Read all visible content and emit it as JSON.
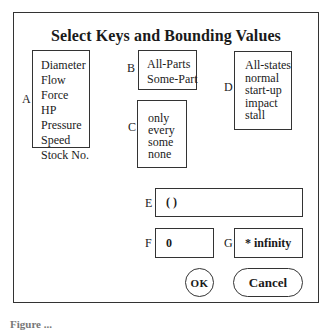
{
  "dialog": {
    "title": "Select Keys and Bounding Values"
  },
  "lists": {
    "A": {
      "label": "A",
      "items": [
        "Diameter",
        "Flow",
        "Force",
        "HP",
        "Pressure",
        "Speed",
        "Stock No."
      ]
    },
    "B": {
      "label": "B",
      "items": [
        "All-Parts",
        "Some-Part"
      ]
    },
    "C": {
      "label": "C",
      "items": [
        "only",
        "every",
        "some",
        "none"
      ]
    },
    "D": {
      "label": "D",
      "items": [
        "All-states",
        "normal",
        "start-up",
        "impact",
        "stall"
      ]
    }
  },
  "fields": {
    "E": {
      "label": "E",
      "value": "( )"
    },
    "F": {
      "label": "F",
      "value": "0"
    },
    "G": {
      "label": "G",
      "value": "* infinity"
    }
  },
  "buttons": {
    "ok": "OK",
    "cancel": "Cancel"
  },
  "caption": "Figure ..."
}
